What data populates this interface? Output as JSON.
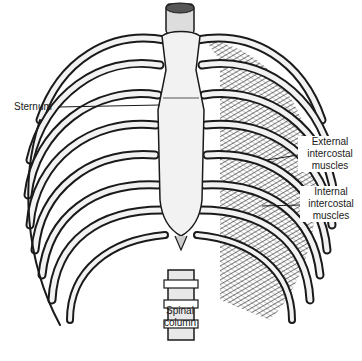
{
  "diagram": {
    "labels": {
      "sternum": "Sternum",
      "external_intercostal": [
        "External",
        "intercostal",
        "muscles"
      ],
      "internal_intercostal": [
        "Internal",
        "intercostal",
        "muscles"
      ],
      "spinal_column": [
        "Spinal",
        "column"
      ]
    },
    "colors": {
      "ink": "#1a1a1a",
      "bone": "#f2f2f2",
      "background": "#ffffff"
    }
  }
}
